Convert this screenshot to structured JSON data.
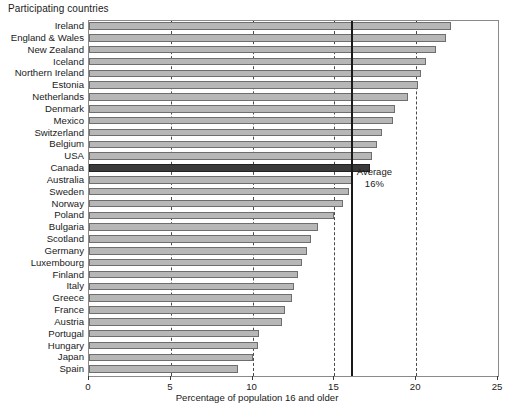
{
  "chart_data": {
    "type": "bar",
    "orientation": "horizontal",
    "title": "Participating countries",
    "xlabel": "Percentage of population 16 and older",
    "ylabel": "",
    "xlim": [
      0,
      25
    ],
    "xticks": [
      0,
      5,
      10,
      15,
      20,
      25
    ],
    "grid": "vertical-dashed",
    "legend": "none",
    "highlight_category": "Canada",
    "annotations": [
      {
        "name": "average-marker",
        "label_line1": "Average",
        "label_line2": "16%",
        "value": 16
      }
    ],
    "categories": [
      "Ireland",
      "England & Wales",
      "New Zealand",
      "Iceland",
      "Northern Ireland",
      "Estonia",
      "Netherlands",
      "Denmark",
      "Mexico",
      "Switzerland",
      "Belgium",
      "USA",
      "Canada",
      "Australia",
      "Sweden",
      "Norway",
      "Poland",
      "Bulgaria",
      "Scotland",
      "Germany",
      "Luxembourg",
      "Finland",
      "Italy",
      "Greece",
      "France",
      "Austria",
      "Portugal",
      "Hungary",
      "Japan",
      "Spain"
    ],
    "values": [
      22.1,
      21.8,
      21.2,
      20.6,
      20.3,
      20.1,
      19.5,
      18.7,
      18.6,
      17.9,
      17.6,
      17.3,
      17.2,
      16.1,
      15.9,
      15.5,
      15.0,
      14.0,
      13.6,
      13.3,
      13.0,
      12.8,
      12.5,
      12.4,
      12.0,
      11.8,
      10.4,
      10.3,
      10.0,
      9.1
    ]
  }
}
